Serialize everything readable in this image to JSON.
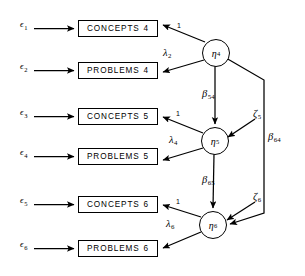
{
  "diagram": {
    "type": "structural-equation-model-path-diagram",
    "background_color": "#ffffff",
    "stroke_color": "#000000",
    "observed_variables": [
      {
        "id": "concepts4",
        "name": "CONCEPTS",
        "wave": "4",
        "x": 78,
        "y": 20,
        "w": 80,
        "h": 17
      },
      {
        "id": "problems4",
        "name": "PROBLEMS",
        "wave": "4",
        "x": 78,
        "y": 62,
        "w": 80,
        "h": 17
      },
      {
        "id": "concepts5",
        "name": "CONCEPTS",
        "wave": "5",
        "x": 78,
        "y": 108,
        "w": 80,
        "h": 17
      },
      {
        "id": "problems5",
        "name": "PROBLEMS",
        "wave": "5",
        "x": 78,
        "y": 148,
        "w": 80,
        "h": 17
      },
      {
        "id": "concepts6",
        "name": "CONCEPTS",
        "wave": "6",
        "x": 78,
        "y": 196,
        "w": 80,
        "h": 17
      },
      {
        "id": "problems6",
        "name": "PROBLEMS",
        "wave": "6",
        "x": 78,
        "y": 240,
        "w": 80,
        "h": 17
      }
    ],
    "latent_variables": [
      {
        "id": "eta4",
        "symbol": "η",
        "subscript": "4",
        "cx": 215,
        "cy": 52,
        "r": 13
      },
      {
        "id": "eta5",
        "symbol": "η",
        "subscript": "5",
        "cx": 214,
        "cy": 140,
        "r": 13
      },
      {
        "id": "eta6",
        "symbol": "η",
        "subscript": "6",
        "cx": 212,
        "cy": 224,
        "r": 13
      }
    ],
    "errors": [
      {
        "id": "eps1",
        "symbol": "ϵ",
        "subscript": "1",
        "x": 20,
        "y": 19
      },
      {
        "id": "eps2",
        "symbol": "ϵ",
        "subscript": "2",
        "x": 20,
        "y": 61
      },
      {
        "id": "eps3",
        "symbol": "ϵ",
        "subscript": "3",
        "x": 20,
        "y": 107
      },
      {
        "id": "eps4",
        "symbol": "ϵ",
        "subscript": "4",
        "x": 20,
        "y": 147
      },
      {
        "id": "eps5",
        "symbol": "ϵ",
        "subscript": "5",
        "x": 20,
        "y": 195
      },
      {
        "id": "eps6",
        "symbol": "ϵ",
        "subscript": "6",
        "x": 20,
        "y": 239
      }
    ],
    "disturbances": [
      {
        "id": "zeta5",
        "symbol": "ζ",
        "subscript": "5",
        "x": 253,
        "y": 110
      },
      {
        "id": "zeta6",
        "symbol": "ζ",
        "subscript": "6",
        "x": 253,
        "y": 193
      }
    ],
    "loading_labels": [
      {
        "id": "load1",
        "text": "1",
        "x": 177,
        "y": 24,
        "kind": "fixed"
      },
      {
        "id": "lambda2",
        "symbol": "λ",
        "subscript": "2",
        "x": 165,
        "y": 49,
        "kind": "free"
      },
      {
        "id": "load3",
        "text": "1",
        "x": 176,
        "y": 112,
        "kind": "fixed"
      },
      {
        "id": "lambda4",
        "symbol": "λ",
        "subscript": "4",
        "x": 170,
        "y": 136,
        "kind": "free"
      },
      {
        "id": "load5",
        "text": "1",
        "x": 176,
        "y": 200,
        "kind": "fixed"
      },
      {
        "id": "lambda6",
        "symbol": "λ",
        "subscript": "6",
        "x": 167,
        "y": 219,
        "kind": "free"
      }
    ],
    "structural_labels": [
      {
        "id": "beta54",
        "symbol": "β",
        "subscript": "54",
        "x": 203,
        "y": 90
      },
      {
        "id": "beta65",
        "symbol": "β",
        "subscript": "65",
        "x": 203,
        "y": 176
      },
      {
        "id": "beta64",
        "symbol": "β",
        "subscript": "64",
        "x": 266,
        "y": 133
      }
    ],
    "edges": [
      {
        "from": "eps1",
        "to": "concepts4",
        "label": null
      },
      {
        "from": "eps2",
        "to": "problems4",
        "label": null
      },
      {
        "from": "eps3",
        "to": "concepts5",
        "label": null
      },
      {
        "from": "eps4",
        "to": "problems5",
        "label": null
      },
      {
        "from": "eps5",
        "to": "concepts6",
        "label": null
      },
      {
        "from": "eps6",
        "to": "problems6",
        "label": null
      },
      {
        "from": "eta4",
        "to": "concepts4",
        "label": "1"
      },
      {
        "from": "eta4",
        "to": "problems4",
        "label": "λ2"
      },
      {
        "from": "eta5",
        "to": "concepts5",
        "label": "1"
      },
      {
        "from": "eta5",
        "to": "problems5",
        "label": "λ4"
      },
      {
        "from": "eta6",
        "to": "concepts6",
        "label": "1"
      },
      {
        "from": "eta6",
        "to": "problems6",
        "label": "λ6"
      },
      {
        "from": "eta4",
        "to": "eta5",
        "label": "β54"
      },
      {
        "from": "eta5",
        "to": "eta6",
        "label": "β65"
      },
      {
        "from": "eta4",
        "to": "eta6",
        "label": "β64"
      },
      {
        "from": "zeta5",
        "to": "eta5",
        "label": null
      },
      {
        "from": "zeta6",
        "to": "eta6",
        "label": null
      }
    ]
  }
}
